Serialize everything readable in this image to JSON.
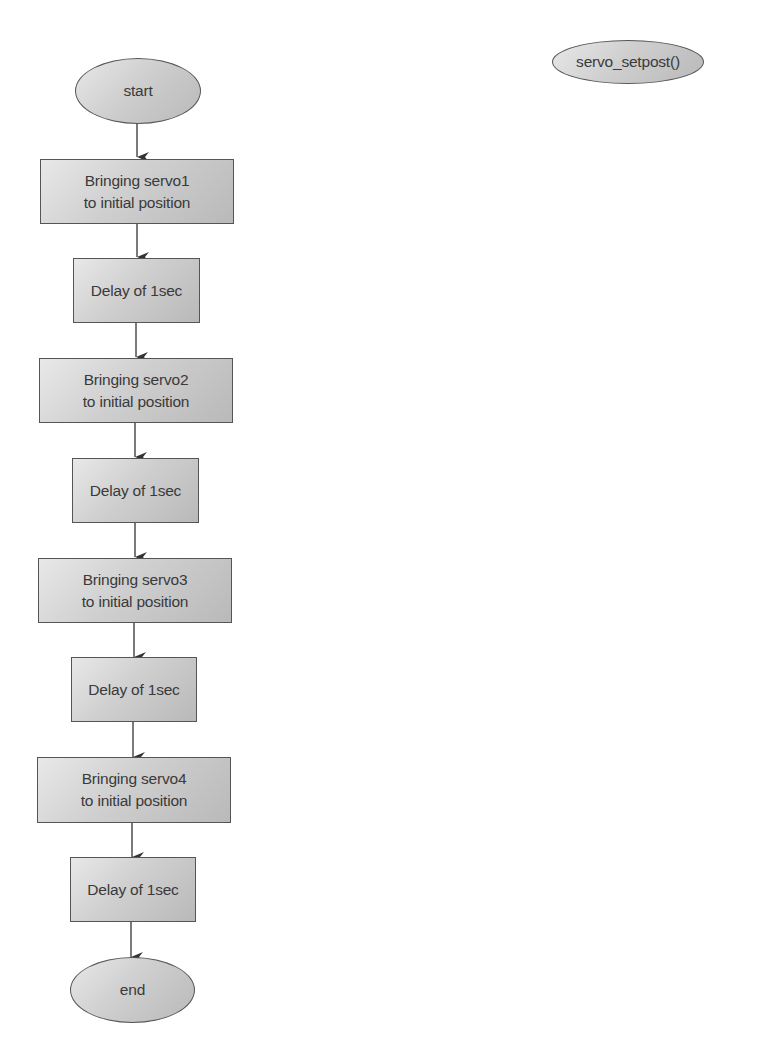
{
  "diagram": {
    "type": "flowchart",
    "function_label": "servo_setpost()",
    "nodes": [
      {
        "id": "start",
        "shape": "oval",
        "label": "start"
      },
      {
        "id": "s1",
        "shape": "rect",
        "label": "Bringing servo1\nto initial position"
      },
      {
        "id": "d1",
        "shape": "rect",
        "label": "Delay of 1sec"
      },
      {
        "id": "s2",
        "shape": "rect",
        "label": "Bringing servo2\nto initial position"
      },
      {
        "id": "d2",
        "shape": "rect",
        "label": "Delay of 1sec"
      },
      {
        "id": "s3",
        "shape": "rect",
        "label": "Bringing servo3\nto initial position"
      },
      {
        "id": "d3",
        "shape": "rect",
        "label": "Delay of 1sec"
      },
      {
        "id": "s4",
        "shape": "rect",
        "label": "Bringing servo4\nto initial position"
      },
      {
        "id": "d4",
        "shape": "rect",
        "label": "Delay of 1sec"
      },
      {
        "id": "end",
        "shape": "oval",
        "label": "end"
      }
    ],
    "edges": [
      [
        "start",
        "s1"
      ],
      [
        "s1",
        "d1"
      ],
      [
        "d1",
        "s2"
      ],
      [
        "s2",
        "d2"
      ],
      [
        "d2",
        "s3"
      ],
      [
        "s3",
        "d3"
      ],
      [
        "d3",
        "s4"
      ],
      [
        "s4",
        "d4"
      ],
      [
        "d4",
        "end"
      ]
    ]
  },
  "colors": {
    "node_fill": "#cfcfcf",
    "node_border": "#555555",
    "text": "#3a3a3a",
    "arrow": "#333333"
  }
}
